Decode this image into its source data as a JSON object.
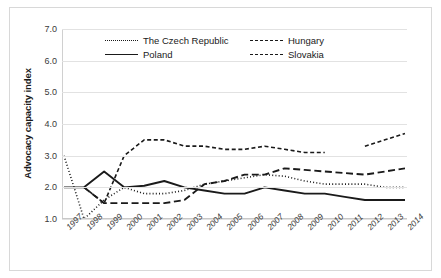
{
  "chart_data": {
    "type": "line",
    "title": "",
    "xlabel": "",
    "ylabel": "Advocacy capacity index",
    "x": [
      "1997",
      "1998",
      "1999",
      "2000",
      "2001",
      "2002",
      "2003",
      "2004",
      "2005",
      "2006",
      "2007",
      "2008",
      "2009",
      "2010",
      "2011",
      "2012",
      "2013",
      "2014"
    ],
    "ylim": [
      1.0,
      7.0
    ],
    "yticks": [
      "1.0",
      "2.0",
      "3.0",
      "4.0",
      "5.0",
      "6.0",
      "7.0"
    ],
    "grid": true,
    "legend_position": "top-center",
    "series": [
      {
        "name": "The Czech Republic",
        "style": "dotted",
        "values": [
          3.0,
          1.0,
          1.6,
          2.0,
          1.8,
          1.8,
          1.9,
          2.1,
          2.2,
          2.3,
          2.4,
          2.35,
          2.2,
          2.1,
          2.1,
          2.1,
          2.0,
          2.0
        ]
      },
      {
        "name": "Poland",
        "style": "solid",
        "values": [
          2.0,
          2.0,
          2.5,
          2.0,
          2.05,
          2.2,
          2.0,
          1.9,
          1.8,
          1.8,
          2.0,
          1.9,
          1.8,
          1.8,
          1.7,
          1.6,
          1.6,
          1.6
        ]
      },
      {
        "name": "Hungary",
        "style": "dashed",
        "values": [
          null,
          2.0,
          1.5,
          3.0,
          3.5,
          3.5,
          3.3,
          3.3,
          3.2,
          3.2,
          3.3,
          3.2,
          3.1,
          3.1,
          null,
          3.3,
          3.5,
          3.7
        ]
      },
      {
        "name": "Slovakia",
        "style": "long-dash",
        "values": [
          null,
          2.0,
          1.5,
          1.5,
          1.5,
          1.5,
          1.6,
          2.1,
          2.2,
          2.4,
          2.4,
          2.6,
          2.55,
          2.5,
          2.45,
          2.4,
          2.5,
          2.6
        ]
      }
    ],
    "legend": [
      {
        "label": "The Czech Republic",
        "style": "dotted"
      },
      {
        "label": "Hungary",
        "style": "dashed"
      },
      {
        "label": "Poland",
        "style": "solid"
      },
      {
        "label": "Slovakia",
        "style": "long-dash"
      }
    ],
    "colors": {
      "line": "#1a1a1a",
      "grid": "#e2e2e2",
      "border": "#d8d8d8"
    }
  }
}
